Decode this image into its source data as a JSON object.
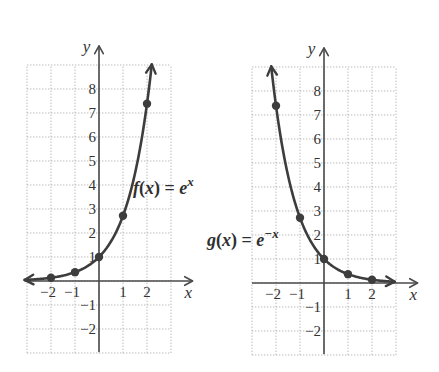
{
  "figure": {
    "background": "#ffffff",
    "curve_color": "#3d3d3d",
    "axis_color": "#4a4a4a",
    "grid_color": "#b9b9b9"
  },
  "chart_data": [
    {
      "type": "line",
      "title": "",
      "function": "e^x",
      "exp_sign": 1,
      "function_label": {
        "name": "f(x)",
        "equals": "=",
        "base": "e",
        "exponent": "x"
      },
      "xlabel": "x",
      "ylabel": "y",
      "xlim": [
        -3,
        3
      ],
      "ylim": [
        -3,
        9
      ],
      "grid": true,
      "x_tick_labels": [
        {
          "value": -2,
          "label": "−2"
        },
        {
          "value": -1,
          "label": "−1"
        },
        {
          "value": 1,
          "label": "1"
        },
        {
          "value": 2,
          "label": "2"
        }
      ],
      "y_tick_labels": [
        {
          "value": -2,
          "label": "−2"
        },
        {
          "value": -1,
          "label": "−1"
        },
        {
          "value": 1,
          "label": "1"
        },
        {
          "value": 2,
          "label": "2"
        },
        {
          "value": 3,
          "label": "3"
        },
        {
          "value": 4,
          "label": "4"
        },
        {
          "value": 5,
          "label": "5"
        },
        {
          "value": 6,
          "label": "6"
        },
        {
          "value": 7,
          "label": "7"
        },
        {
          "value": 8,
          "label": "8"
        }
      ],
      "curve_domain": [
        -3.1,
        2.2
      ],
      "series": [
        {
          "name": "f(x) = e^x",
          "x": [
            -2,
            -1,
            0,
            1,
            2
          ],
          "y": [
            0.14,
            0.37,
            1,
            2.72,
            7.39
          ]
        }
      ]
    },
    {
      "type": "line",
      "title": "",
      "function": "e^-x",
      "exp_sign": -1,
      "function_label": {
        "name": "g(x)",
        "equals": "=",
        "base": "e",
        "exponent": "−x"
      },
      "xlabel": "x",
      "ylabel": "y",
      "xlim": [
        -3,
        3
      ],
      "ylim": [
        -3,
        9
      ],
      "grid": true,
      "x_tick_labels": [
        {
          "value": -2,
          "label": "−2"
        },
        {
          "value": -1,
          "label": "−1"
        },
        {
          "value": 1,
          "label": "1"
        },
        {
          "value": 2,
          "label": "2"
        }
      ],
      "y_tick_labels": [
        {
          "value": -2,
          "label": "−2"
        },
        {
          "value": -1,
          "label": "−1"
        },
        {
          "value": 1,
          "label": "1"
        },
        {
          "value": 2,
          "label": "2"
        },
        {
          "value": 3,
          "label": "3"
        },
        {
          "value": 4,
          "label": "4"
        },
        {
          "value": 5,
          "label": "5"
        },
        {
          "value": 6,
          "label": "6"
        },
        {
          "value": 7,
          "label": "7"
        },
        {
          "value": 8,
          "label": "8"
        }
      ],
      "curve_domain": [
        -2.2,
        2.95
      ],
      "series": [
        {
          "name": "g(x) = e^−x",
          "x": [
            -2,
            -1,
            0,
            1,
            2
          ],
          "y": [
            7.39,
            2.72,
            1,
            0.37,
            0.14
          ]
        }
      ]
    }
  ]
}
